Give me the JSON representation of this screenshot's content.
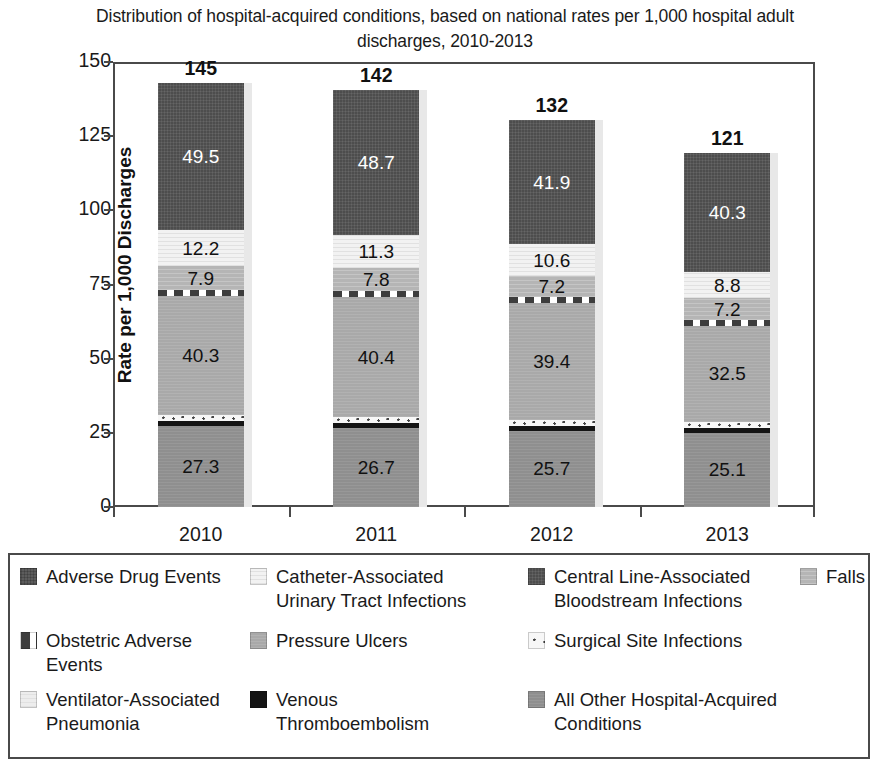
{
  "chart_data": {
    "type": "bar",
    "subtype": "stacked-bar",
    "title": "Distribution of hospital-acquired conditions, based on national rates per 1,000 hospital adult discharges, 2010-2013",
    "xlabel": "",
    "ylabel": "Rate per 1,000 Discharges",
    "ylim": [
      0,
      150
    ],
    "yticks": [
      0,
      25,
      50,
      75,
      100,
      125,
      150
    ],
    "grid": false,
    "legend_position": "bottom",
    "categories": [
      "2010",
      "2011",
      "2012",
      "2013"
    ],
    "totals": [
      "145",
      "142",
      "132",
      "121"
    ],
    "series": [
      {
        "name": "All Other Hospital-Acquired Conditions",
        "key": "other",
        "values": [
          27.3,
          26.7,
          25.7,
          25.1
        ],
        "labels": [
          "27.3",
          "26.7",
          "25.7",
          "25.1"
        ],
        "label_color": "dark"
      },
      {
        "name": "Venous Thromboembolism",
        "key": "vte",
        "values": [
          1.6,
          1.6,
          1.6,
          1.5
        ],
        "labels": [
          "",
          "",
          "",
          ""
        ],
        "label_color": "light"
      },
      {
        "name": "Surgical Site Infections",
        "key": "ssi",
        "values": [
          2.0,
          2.0,
          2.0,
          2.0
        ],
        "labels": [
          "",
          "",
          "",
          ""
        ],
        "label_color": "dark"
      },
      {
        "name": "Pressure Ulcers",
        "key": "pu",
        "values": [
          40.3,
          40.4,
          39.4,
          32.5
        ],
        "labels": [
          "40.3",
          "40.4",
          "39.4",
          "32.5"
        ],
        "label_color": "dark"
      },
      {
        "name": "Obstetric Adverse Events",
        "key": "obs",
        "values": [
          2.0,
          2.0,
          2.0,
          2.0
        ],
        "labels": [
          "",
          "",
          "",
          ""
        ],
        "label_color": "dark"
      },
      {
        "name": "Falls",
        "key": "falls",
        "values": [
          7.9,
          7.8,
          7.2,
          7.2
        ],
        "labels": [
          "7.9",
          "7.8",
          "7.2",
          "7.2"
        ],
        "label_color": "dark"
      },
      {
        "name": "Catheter-Associated Urinary Tract Infections",
        "key": "cauti",
        "values": [
          12.2,
          11.3,
          10.6,
          8.8
        ],
        "labels": [
          "12.2",
          "11.3",
          "10.6",
          "8.8"
        ],
        "label_color": "dark"
      },
      {
        "name": "Central Line-Associated Bloodstream Infections",
        "key": "clabsi",
        "values": [
          49.5,
          48.7,
          41.9,
          40.3
        ],
        "labels": [
          "49.5",
          "48.7",
          "41.9",
          "40.3"
        ],
        "label_color": "light"
      }
    ]
  },
  "legend": {
    "entries": [
      {
        "label": "Adverse Drug Events",
        "key": "ade"
      },
      {
        "label": "Catheter-Associated\nUrinary Tract Infections",
        "key": "cauti"
      },
      {
        "label": "Central Line-Associated\nBloodstream Infections",
        "key": "clabsi"
      },
      {
        "label": "Falls",
        "key": "falls"
      },
      {
        "label": "Obstetric Adverse\nEvents",
        "key": "obs"
      },
      {
        "label": "Pressure Ulcers",
        "key": "pu"
      },
      {
        "label": "Surgical Site Infections",
        "key": "ssi"
      },
      {
        "label": "Ventilator-Associated\nPneumonia",
        "key": "vap"
      },
      {
        "label": "Venous\nThromboembolism",
        "key": "vte"
      },
      {
        "label": "All Other Hospital-Acquired\nConditions",
        "key": "other"
      }
    ]
  },
  "colors": {
    "ade": "#5c5c5c",
    "cauti": "#f2f2f2",
    "clabsi": "#4d4d4d",
    "falls": "#b5b5b5",
    "obs": "#ffffff",
    "pu": "#a9a9a9",
    "ssi": "#f7f7f7",
    "vap": "#ededed",
    "vte": "#141414",
    "other": "#8f8f8f",
    "axis": "#4a4a4a",
    "text": "#1a1a1a"
  }
}
